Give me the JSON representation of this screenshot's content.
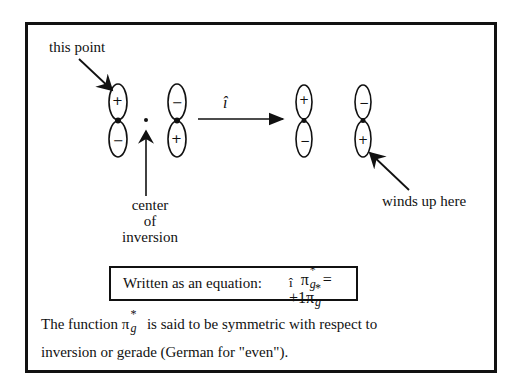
{
  "diagram": {
    "labels": {
      "this_point": "this point",
      "operator": "î",
      "winds_up_here": "winds up here",
      "center_line1": "center",
      "center_line2": "of",
      "center_line3": "inversion"
    },
    "orbitals": [
      {
        "name": "left-before",
        "top_sign": "+",
        "bottom_sign": "−"
      },
      {
        "name": "right-before",
        "top_sign": "−",
        "bottom_sign": "+"
      },
      {
        "name": "left-after",
        "top_sign": "+",
        "bottom_sign": "−"
      },
      {
        "name": "right-after",
        "top_sign": "−",
        "bottom_sign": "+"
      }
    ]
  },
  "equation": {
    "prefix": "Written as an equation:",
    "operator": "î",
    "lhs_symbol": "π",
    "sup": "*",
    "sub": "g",
    "equals": "=",
    "coefficient": "+1",
    "rhs_symbol": "π"
  },
  "paragraph": {
    "line1_start": "The function",
    "symbol": "π",
    "sup": "*",
    "sub": "g",
    "line1_end": "is said to be symmetric with respect to",
    "line2": "inversion or gerade (German for \"even\")."
  }
}
